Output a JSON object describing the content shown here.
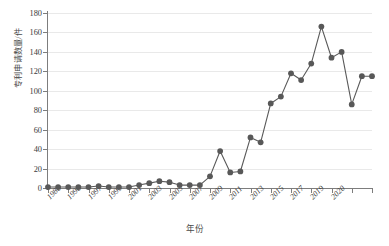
{
  "chart_data": {
    "type": "line",
    "title": "",
    "xlabel": "年份",
    "ylabel": "专利申请数量/件",
    "ylim": [
      0,
      180
    ],
    "ytick_values": [
      0,
      20,
      40,
      60,
      80,
      100,
      120,
      140,
      160,
      180
    ],
    "ytick_labels": [
      "0",
      "20",
      "40",
      "60",
      "80",
      "100",
      "120",
      "140",
      "160",
      "180"
    ],
    "xlim": [
      1988,
      2020
    ],
    "xtick_values": [
      1988,
      1990,
      1992,
      1994,
      1996,
      1998,
      2000,
      2002,
      2004,
      2006,
      2008,
      2010,
      2012,
      2014,
      2016,
      2018,
      2020
    ],
    "xtick_labels": [
      "1988",
      "1990",
      "1997",
      "1999",
      "2001",
      "2003",
      "2005",
      "2007",
      "2009",
      "2011",
      "2013",
      "2015",
      "2017",
      "2019",
      "2020"
    ],
    "xtick_label_positions": [
      1988,
      1990,
      1992,
      1994,
      1996,
      1998,
      2000,
      2002,
      2004,
      2006,
      2008,
      2010,
      2012,
      2014,
      2016
    ],
    "grid": "horizontal",
    "legend": "none",
    "marker": "circle",
    "series_color": "#585858",
    "grid_color": "#e9e9e9",
    "axis_color": "#7d7d7d",
    "x": [
      1988,
      1989,
      1990,
      1991,
      1992,
      1993,
      1994,
      1995,
      1996,
      1997,
      1998,
      1999,
      2000,
      2001,
      2002,
      2003,
      2004,
      2005,
      2006,
      2007,
      2008,
      2009,
      2010,
      2011,
      2012,
      2013,
      2014,
      2015,
      2016,
      2017,
      2018,
      2019,
      2020
    ],
    "values": [
      1,
      1,
      1,
      1,
      1,
      2,
      1,
      1,
      1,
      3,
      5,
      7,
      6,
      3,
      3,
      3,
      12,
      38,
      16,
      17,
      52,
      47,
      87,
      94,
      118,
      111,
      128,
      166,
      134,
      140,
      86,
      115,
      115
    ],
    "series": [
      {
        "name": "专利申请数量",
        "values": [
          1,
          1,
          1,
          1,
          1,
          2,
          1,
          1,
          1,
          3,
          5,
          7,
          6,
          3,
          3,
          3,
          12,
          38,
          16,
          17,
          52,
          47,
          87,
          94,
          118,
          111,
          128,
          166,
          134,
          140,
          86,
          115,
          115
        ]
      }
    ],
    "points": [
      {
        "x": 1988,
        "y": 1
      },
      {
        "x": 1989,
        "y": 1
      },
      {
        "x": 1990,
        "y": 1
      },
      {
        "x": 1991,
        "y": 1
      },
      {
        "x": 1992,
        "y": 1
      },
      {
        "x": 1993,
        "y": 2
      },
      {
        "x": 1994,
        "y": 1
      },
      {
        "x": 1995,
        "y": 1
      },
      {
        "x": 1996,
        "y": 1
      },
      {
        "x": 1997,
        "y": 3
      },
      {
        "x": 1998,
        "y": 5
      },
      {
        "x": 1999,
        "y": 7
      },
      {
        "x": 2000,
        "y": 6
      },
      {
        "x": 2001,
        "y": 3
      },
      {
        "x": 2002,
        "y": 3
      },
      {
        "x": 2003,
        "y": 3
      },
      {
        "x": 2004,
        "y": 12
      },
      {
        "x": 2005,
        "y": 38
      },
      {
        "x": 2006,
        "y": 16
      },
      {
        "x": 2007,
        "y": 17
      },
      {
        "x": 2008,
        "y": 52
      },
      {
        "x": 2009,
        "y": 47
      },
      {
        "x": 2010,
        "y": 87
      },
      {
        "x": 2011,
        "y": 94
      },
      {
        "x": 2012,
        "y": 118
      },
      {
        "x": 2013,
        "y": 111
      },
      {
        "x": 2014,
        "y": 128
      },
      {
        "x": 2015,
        "y": 166
      },
      {
        "x": 2016,
        "y": 134
      },
      {
        "x": 2017,
        "y": 140
      },
      {
        "x": 2018,
        "y": 86
      },
      {
        "x": 2019,
        "y": 115
      },
      {
        "x": 2020,
        "y": 115
      }
    ]
  }
}
